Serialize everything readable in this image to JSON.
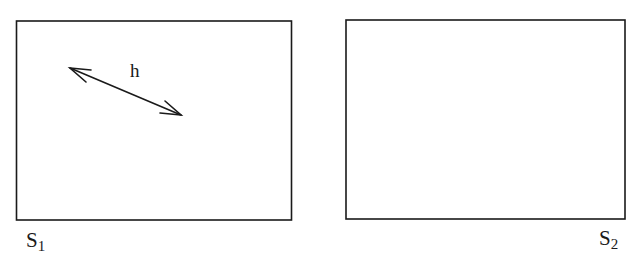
{
  "diagram": {
    "panels": [
      {
        "id": "S1",
        "label_main": "S",
        "label_sub": "1",
        "has_arrow": true
      },
      {
        "id": "S2",
        "label_main": "S",
        "label_sub": "2",
        "has_arrow": false
      }
    ],
    "arrow": {
      "label": "h",
      "type": "double-headed"
    },
    "colors": {
      "stroke": "#1a1a1a",
      "background": "#ffffff"
    }
  }
}
